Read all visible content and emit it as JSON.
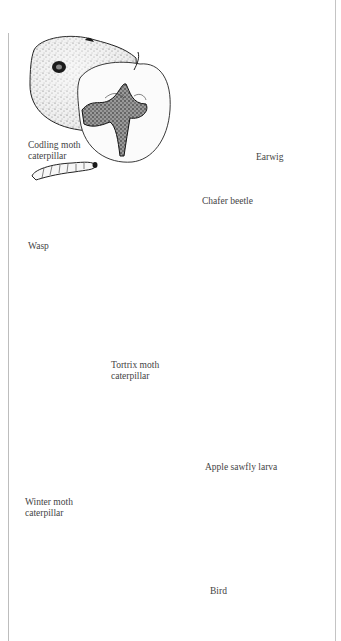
{
  "figure": {
    "panels": [
      {
        "id": "codling-moth",
        "label": "Codling moth\ncaterpillar",
        "subject": "Codling moth caterpillar"
      },
      {
        "id": "earwig",
        "label": "Earwig",
        "subject": "Earwig"
      },
      {
        "id": "wasp",
        "label": "Wasp",
        "subject": "Wasp"
      },
      {
        "id": "chafer-beetle",
        "label": "Chafer beetle",
        "subject": "Chafer beetle"
      },
      {
        "id": "tortrix-moth",
        "label": "Tortrix moth\ncaterpillar",
        "subject": "Tortrix moth caterpillar"
      },
      {
        "id": "apple-sawfly",
        "label": "Apple sawfly larva",
        "subject": "Apple sawfly larva"
      },
      {
        "id": "winter-moth",
        "label": "Winter moth\ncaterpillar",
        "subject": "Winter moth caterpillar"
      },
      {
        "id": "bird",
        "label": "Bird",
        "subject": "Bird"
      }
    ],
    "colors": {
      "ink": "#1b1b1b",
      "paper": "#ffffff",
      "frame": "#bdbdbd",
      "label": "#444444"
    }
  }
}
